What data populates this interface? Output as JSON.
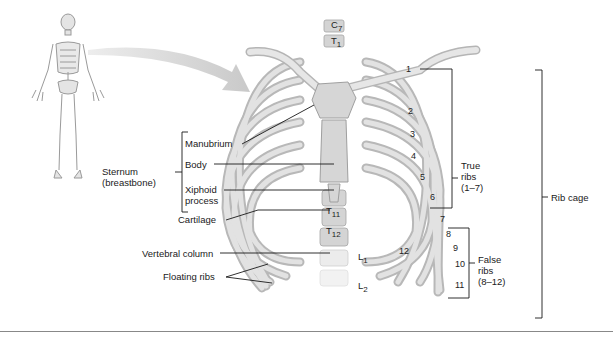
{
  "labels": {
    "sternum": "Sternum",
    "sternum_alt": "(breastbone)",
    "manubrium": "Manubrium",
    "body": "Body",
    "xiphoid_1": "Xiphoid",
    "xiphoid_2": "process",
    "cartilage": "Cartilage",
    "vertebral_column": "Vertebral column",
    "floating_ribs": "Floating ribs",
    "true_ribs_1": "True",
    "true_ribs_2": "ribs",
    "true_ribs_3": "(1–7)",
    "false_ribs_1": "False",
    "false_ribs_2": "ribs",
    "false_ribs_3": "(8–12)",
    "rib_cage": "Rib cage"
  },
  "vertebrae": {
    "c7_letter": "C",
    "c7_num": "7",
    "t1_letter": "T",
    "t1_num": "1",
    "t11_letter": "T",
    "t11_num": "11",
    "t12_letter": "T",
    "t12_num": "12",
    "l1_letter": "L",
    "l1_num": "1",
    "l2_letter": "L",
    "l2_num": "2"
  },
  "rib_numbers": [
    "1",
    "2",
    "3",
    "4",
    "5",
    "6",
    "7",
    "8",
    "9",
    "10",
    "11",
    "12"
  ],
  "colors": {
    "bone": "#d9d9d9",
    "bone_shade": "#a9a9a9",
    "cartilage": "#c4c4c4",
    "leader_line": "#1a1a1a",
    "arrow": "#cfcfcf"
  }
}
